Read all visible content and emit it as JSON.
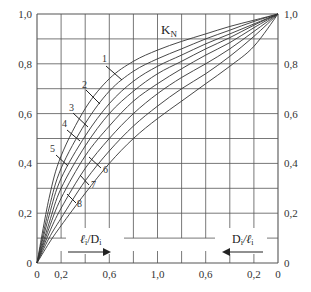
{
  "chart_data": {
    "type": "line",
    "title_main": "K",
    "title_sub": "N",
    "xlabel_left": "ℓi/Di",
    "xlabel_right": "Di/ℓi",
    "xlabel_left_parts": [
      "ℓ",
      "i",
      "/D",
      "i"
    ],
    "xlabel_right_parts": [
      "D",
      "i",
      "/ℓ",
      "i"
    ],
    "x_tick_labels": [
      "0",
      "0,2",
      "0,6",
      "1,0",
      "0,6",
      "0,2",
      "0"
    ],
    "x_tick_positions_u": [
      0.0,
      0.1,
      0.3,
      0.5,
      0.7,
      0.9,
      1.0
    ],
    "y_tick_labels": [
      "0",
      "0,2",
      "0,4",
      "0,6",
      "0,8",
      "1,0"
    ],
    "y_ticks": [
      0,
      0.2,
      0.4,
      0.6,
      0.8,
      1.0
    ],
    "ylim": [
      0,
      1.0
    ],
    "x_note": "horizontal axis runs 0→1,0 (ℓi/Di) then 1,0→0 (Di/ℓi); u is normalized position across full width",
    "grid": true,
    "grid_columns": 10,
    "grid_rows": 10,
    "series": [
      {
        "name": "1",
        "u": [
          0,
          0.05,
          0.1,
          0.2,
          0.3,
          0.4,
          0.5,
          0.6,
          0.7,
          0.8,
          0.9,
          1.0
        ],
        "K": [
          0,
          0.26,
          0.43,
          0.62,
          0.74,
          0.81,
          0.855,
          0.89,
          0.92,
          0.95,
          0.975,
          1.0
        ]
      },
      {
        "name": "2",
        "u": [
          0,
          0.05,
          0.1,
          0.2,
          0.3,
          0.4,
          0.5,
          0.6,
          0.7,
          0.8,
          0.9,
          1.0
        ],
        "K": [
          0,
          0.22,
          0.38,
          0.56,
          0.69,
          0.77,
          0.82,
          0.86,
          0.9,
          0.935,
          0.97,
          1.0
        ]
      },
      {
        "name": "3",
        "u": [
          0,
          0.05,
          0.1,
          0.2,
          0.3,
          0.4,
          0.5,
          0.6,
          0.7,
          0.8,
          0.9,
          1.0
        ],
        "K": [
          0,
          0.19,
          0.34,
          0.51,
          0.64,
          0.73,
          0.79,
          0.835,
          0.88,
          0.92,
          0.96,
          1.0
        ]
      },
      {
        "name": "4",
        "u": [
          0,
          0.05,
          0.1,
          0.2,
          0.3,
          0.4,
          0.5,
          0.6,
          0.7,
          0.8,
          0.9,
          1.0
        ],
        "K": [
          0,
          0.16,
          0.3,
          0.47,
          0.6,
          0.69,
          0.76,
          0.81,
          0.86,
          0.905,
          0.955,
          1.0
        ]
      },
      {
        "name": "5",
        "u": [
          0,
          0.05,
          0.1,
          0.2,
          0.3,
          0.4,
          0.5,
          0.6,
          0.7,
          0.8,
          0.9,
          1.0
        ],
        "K": [
          0,
          0.14,
          0.26,
          0.43,
          0.55,
          0.65,
          0.72,
          0.78,
          0.835,
          0.885,
          0.945,
          1.0
        ]
      },
      {
        "name": "6",
        "u": [
          0,
          0.05,
          0.1,
          0.2,
          0.3,
          0.4,
          0.5,
          0.6,
          0.7,
          0.8,
          0.9,
          1.0
        ],
        "K": [
          0,
          0.12,
          0.22,
          0.38,
          0.5,
          0.6,
          0.68,
          0.745,
          0.8,
          0.86,
          0.93,
          1.0
        ]
      },
      {
        "name": "7",
        "u": [
          0,
          0.05,
          0.1,
          0.2,
          0.3,
          0.4,
          0.5,
          0.6,
          0.7,
          0.8,
          0.9,
          1.0
        ],
        "K": [
          0,
          0.1,
          0.18,
          0.33,
          0.45,
          0.55,
          0.63,
          0.7,
          0.76,
          0.83,
          0.91,
          1.0
        ]
      },
      {
        "name": "8",
        "u": [
          0,
          0.05,
          0.1,
          0.2,
          0.3,
          0.4,
          0.5,
          0.6,
          0.7,
          0.8,
          0.9,
          1.0
        ],
        "K": [
          0,
          0.08,
          0.15,
          0.28,
          0.4,
          0.5,
          0.58,
          0.65,
          0.72,
          0.79,
          0.87,
          1.0
        ]
      }
    ],
    "curve_labels": [
      {
        "name": "1",
        "text_x": 102,
        "text_y": 62,
        "line": [
          106,
          66,
          122,
          80
        ]
      },
      {
        "name": "2",
        "text_x": 82,
        "text_y": 88,
        "line": [
          86,
          90,
          100,
          104
        ]
      },
      {
        "name": "3",
        "text_x": 69,
        "text_y": 111,
        "line": [
          73,
          113,
          88,
          127
        ]
      },
      {
        "name": "4",
        "text_x": 62,
        "text_y": 127,
        "line": [
          67,
          130,
          80,
          141
        ]
      },
      {
        "name": "5",
        "text_x": 50,
        "text_y": 152,
        "line": [
          56,
          155,
          68,
          166
        ]
      },
      {
        "name": "6",
        "text_x": 103,
        "text_y": 173,
        "line": [
          89,
          157,
          101,
          168
        ]
      },
      {
        "name": "7",
        "text_x": 91,
        "text_y": 188,
        "line": [
          80,
          175,
          89,
          185
        ]
      },
      {
        "name": "8",
        "text_x": 77,
        "text_y": 207,
        "line": [
          67,
          194,
          76,
          203
        ]
      }
    ]
  }
}
